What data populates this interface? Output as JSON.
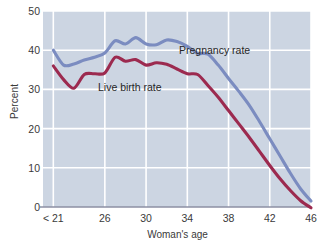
{
  "chart_data": {
    "type": "line",
    "title": "",
    "xlabel": "Woman's age",
    "ylabel": "Percent",
    "xlim": [
      20,
      46
    ],
    "ylim": [
      0,
      50
    ],
    "grid": true,
    "legend_position": "inline-annotation",
    "x_tick_labels": [
      "< 21",
      "26",
      "30",
      "34",
      "38",
      "42",
      "46"
    ],
    "x_tick_values": [
      21,
      26,
      30,
      34,
      38,
      42,
      46
    ],
    "y_tick_labels": [
      "0",
      "10",
      "20",
      "30",
      "40",
      "50"
    ],
    "y_tick_values": [
      0,
      10,
      20,
      30,
      40,
      50
    ],
    "x": [
      21,
      22,
      23,
      24,
      25,
      26,
      27,
      28,
      29,
      30,
      31,
      32,
      33,
      34,
      35,
      36,
      37,
      38,
      39,
      40,
      41,
      42,
      43,
      44,
      45,
      46
    ],
    "series": [
      {
        "name": "Pregnancy rate",
        "color": "#7b8cc0",
        "values": [
          40.0,
          36.2,
          36.5,
          37.5,
          38.2,
          39.3,
          42.4,
          41.6,
          43.2,
          41.6,
          41.4,
          42.6,
          42.2,
          41.0,
          39.2,
          39.0,
          36.2,
          32.8,
          29.5,
          26.0,
          21.8,
          17.4,
          13.0,
          8.6,
          4.6,
          1.5
        ],
        "annotation": {
          "text": "Pregnancy rate",
          "x": 38.0,
          "y": 45.0
        }
      },
      {
        "name": "Live birth rate",
        "color": "#9c2a4f",
        "values": [
          36.0,
          32.5,
          30.3,
          33.8,
          34.0,
          34.2,
          38.2,
          37.2,
          37.6,
          36.2,
          36.8,
          36.4,
          35.2,
          34.0,
          33.8,
          31.0,
          28.0,
          24.6,
          21.2,
          17.8,
          14.2,
          10.6,
          7.2,
          4.2,
          1.6,
          -0.2
        ],
        "annotation": {
          "text": "Live birth rate",
          "x": 28.5,
          "y": 32.0
        }
      }
    ]
  },
  "colors": {
    "plot_background": "#ccd5e2",
    "gridline": "#ffffff",
    "axis_line": "#8d8fa3",
    "page_background": "#ffffff",
    "text": "#3a3a3a",
    "pregnancy_series": "#7b8cc0",
    "live_birth_series": "#9c2a4f"
  }
}
